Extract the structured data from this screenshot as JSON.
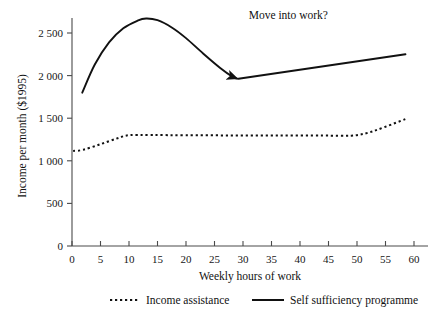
{
  "chart_data": {
    "type": "line",
    "title": "",
    "xlabel": "Weekly hours of work",
    "ylabel": "Income per month ($1995)",
    "xlim": [
      0,
      60
    ],
    "ylim": [
      0,
      2750
    ],
    "grid": false,
    "legend_position": "bottom",
    "xticks": [
      "0",
      "5",
      "10",
      "15",
      "20",
      "25",
      "30",
      "35",
      "40",
      "45",
      "50",
      "55",
      "60"
    ],
    "xtick_values": [
      0,
      5,
      10,
      15,
      20,
      25,
      30,
      35,
      40,
      45,
      50,
      55,
      60
    ],
    "yticks": [
      "0",
      "500",
      "1 000",
      "1 500",
      "2 000",
      "2 500"
    ],
    "ytick_values": [
      0,
      500,
      1000,
      1500,
      2000,
      2500
    ],
    "annotations": [
      {
        "text": "Move into work?",
        "x": 31,
        "y": 2660,
        "kind": "arrow-label"
      }
    ],
    "series": [
      {
        "name": "Income assistance",
        "style": "dotted",
        "color": "#111111",
        "points": [
          [
            0.2,
            1115
          ],
          [
            2.0,
            1130
          ],
          [
            5.0,
            1195
          ],
          [
            8.0,
            1265
          ],
          [
            10.0,
            1300
          ],
          [
            14.0,
            1302
          ],
          [
            20.0,
            1300
          ],
          [
            28.0,
            1298
          ],
          [
            36.0,
            1297
          ],
          [
            44.0,
            1296
          ],
          [
            49.0,
            1295
          ],
          [
            52.0,
            1330
          ],
          [
            55.0,
            1400
          ],
          [
            58.5,
            1490
          ]
        ]
      },
      {
        "name": "Self sufficiency programme",
        "style": "solid",
        "color": "#111111",
        "segments": [
          {
            "label": "subsidy-curve",
            "arrow_end": true,
            "points": [
              [
                1.8,
                1800
              ],
              [
                4.0,
                2130
              ],
              [
                6.5,
                2390
              ],
              [
                9.0,
                2555
              ],
              [
                11.5,
                2645
              ],
              [
                13.0,
                2670
              ],
              [
                15.0,
                2650
              ],
              [
                17.5,
                2565
              ],
              [
                20.0,
                2440
              ],
              [
                23.0,
                2260
              ],
              [
                26.0,
                2090
              ],
              [
                28.2,
                1985
              ],
              [
                29.0,
                1965
              ]
            ]
          },
          {
            "label": "work-line",
            "arrow_end": false,
            "points": [
              [
                29.2,
                1963
              ],
              [
                58.5,
                2250
              ]
            ]
          }
        ]
      }
    ],
    "legend": [
      {
        "label": "Income assistance",
        "style": "dotted"
      },
      {
        "label": "Self sufficiency programme",
        "style": "solid"
      }
    ]
  }
}
